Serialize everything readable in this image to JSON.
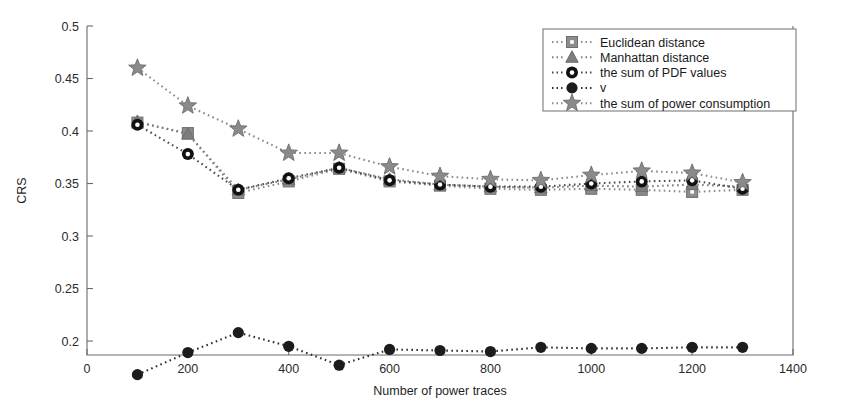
{
  "chart_data": {
    "type": "line",
    "title": "",
    "xlabel": "Number of power traces",
    "ylabel": "CRS",
    "xlim": [
      0,
      1400
    ],
    "ylim": [
      0.1867,
      0.5
    ],
    "grid": false,
    "legend_position": "top-right",
    "xticks": [
      "0",
      "200",
      "400",
      "600",
      "800",
      "1000",
      "1200",
      "1400"
    ],
    "xtick_values": [
      0,
      200,
      400,
      600,
      800,
      1000,
      1200,
      1400
    ],
    "yticks": [
      "0.2",
      "0.25",
      "0.3",
      "0.35",
      "0.4",
      "0.45",
      "0.5"
    ],
    "ytick_values": [
      0.2,
      0.25,
      0.3,
      0.35,
      0.4,
      0.45,
      0.5
    ],
    "x": [
      100,
      200,
      300,
      400,
      500,
      600,
      700,
      800,
      900,
      1000,
      1100,
      1200,
      1300
    ],
    "series": [
      {
        "name": "Euclidean distance",
        "marker": "square",
        "color": "#8c8c8c",
        "line_color": "#8c8c8c",
        "values": [
          0.408,
          0.398,
          0.341,
          0.352,
          0.364,
          0.352,
          0.348,
          0.345,
          0.344,
          0.345,
          0.344,
          0.342,
          0.344
        ]
      },
      {
        "name": "Manhattan distance",
        "marker": "triangle",
        "color": "#7d7d7d",
        "line_color": "#7d7d7d",
        "values": [
          0.409,
          0.397,
          0.344,
          0.354,
          0.365,
          0.354,
          0.349,
          0.347,
          0.346,
          0.348,
          0.347,
          0.349,
          0.347
        ]
      },
      {
        "name": "the sum of PDF values",
        "marker": "circle-open",
        "color": "#1c1c1c",
        "line_color": "#4a4a4a",
        "values": [
          0.406,
          0.378,
          0.344,
          0.355,
          0.365,
          0.353,
          0.349,
          0.347,
          0.347,
          0.35,
          0.352,
          0.353,
          0.345
        ]
      },
      {
        "name": "v",
        "marker": "circle-filled",
        "color": "#1c1c1c",
        "line_color": "#2e2e2e",
        "values": [
          0.168,
          0.189,
          0.208,
          0.195,
          0.177,
          0.192,
          0.191,
          0.19,
          0.194,
          0.193,
          0.193,
          0.194,
          0.194
        ]
      },
      {
        "name": "the sum of power consumption",
        "marker": "star",
        "color": "#8a8a8a",
        "line_color": "#8a8a8a",
        "values": [
          0.46,
          0.424,
          0.402,
          0.379,
          0.379,
          0.366,
          0.357,
          0.354,
          0.353,
          0.358,
          0.362,
          0.36,
          0.351
        ]
      }
    ]
  }
}
